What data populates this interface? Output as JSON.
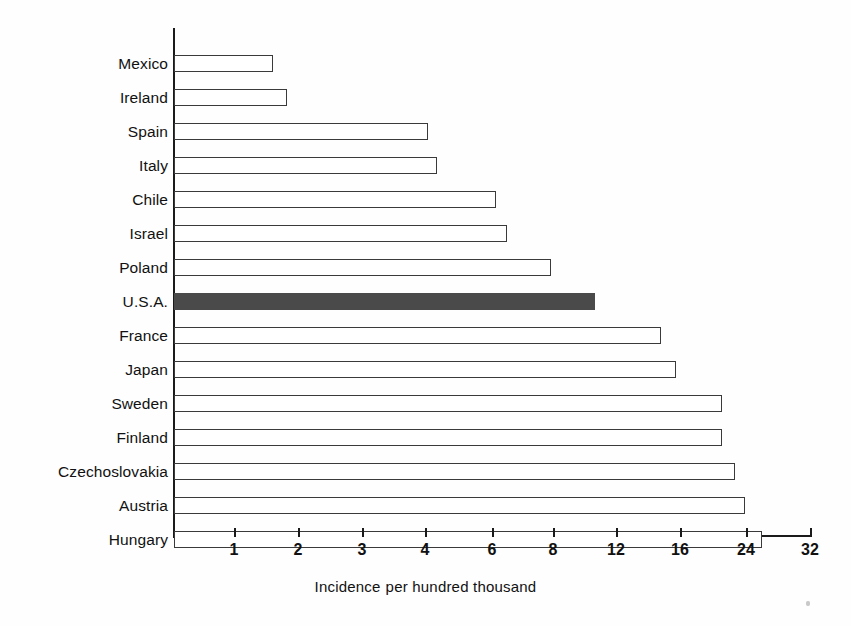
{
  "chart_data": {
    "type": "bar",
    "orientation": "horizontal",
    "title": "",
    "subtitle": "",
    "xlabel": "Incidence  per hundred thousand",
    "ylabel": "",
    "grid": false,
    "legend": null,
    "xscale": "ordinal-log-like",
    "xticks": [
      1,
      2,
      3,
      4,
      6,
      8,
      12,
      16,
      24,
      32
    ],
    "xtick_labels": [
      "1",
      "2",
      "3",
      "4",
      "6",
      "8",
      "12",
      "16",
      "24",
      "32"
    ],
    "xlim": [
      0,
      32
    ],
    "categories": [
      "Mexico",
      "Ireland",
      "Spain",
      "Italy",
      "Chile",
      "Israel",
      "Poland",
      "U.S.A.",
      "France",
      "Japan",
      "Sweden",
      "Finland",
      "Czechoslovakia",
      "Austria",
      "Hungary"
    ],
    "values": [
      1.6,
      1.8,
      4.0,
      4.2,
      6.1,
      6.4,
      7.9,
      11.0,
      14.5,
      15.7,
      20.6,
      20.6,
      22.3,
      23.8,
      25.6
    ],
    "highlighted": [
      "U.S.A."
    ],
    "bar_fill": "#ffffff",
    "bar_stroke": "#3a3a3a",
    "highlight_fill": "#4a4a4a",
    "bars": [
      {
        "label": "Mexico",
        "value": 1.6,
        "px_end": 273,
        "highlight": false
      },
      {
        "label": "Ireland",
        "value": 1.8,
        "px_end": 287,
        "highlight": false
      },
      {
        "label": "Spain",
        "value": 4.0,
        "px_end": 428,
        "highlight": false
      },
      {
        "label": "Italy",
        "value": 4.2,
        "px_end": 437,
        "highlight": false
      },
      {
        "label": "Chile",
        "value": 6.1,
        "px_end": 496,
        "highlight": false
      },
      {
        "label": "Israel",
        "value": 6.4,
        "px_end": 507,
        "highlight": false
      },
      {
        "label": "Poland",
        "value": 7.9,
        "px_end": 551,
        "highlight": false
      },
      {
        "label": "U.S.A.",
        "value": 11.0,
        "px_end": 595,
        "highlight": true
      },
      {
        "label": "France",
        "value": 14.5,
        "px_end": 661,
        "highlight": false
      },
      {
        "label": "Japan",
        "value": 15.7,
        "px_end": 676,
        "highlight": false
      },
      {
        "label": "Sweden",
        "value": 20.6,
        "px_end": 722,
        "highlight": false
      },
      {
        "label": "Finland",
        "value": 20.6,
        "px_end": 722,
        "highlight": false
      },
      {
        "label": "Czechoslovakia",
        "value": 22.3,
        "px_end": 735,
        "highlight": false
      },
      {
        "label": "Austria",
        "value": 23.8,
        "px_end": 745,
        "highlight": false
      },
      {
        "label": "Hungary",
        "value": 25.6,
        "px_end": 762,
        "highlight": false
      }
    ]
  },
  "axis": {
    "x_origin_px": 174,
    "y_top_px": 28,
    "y_bottom_px": 537,
    "x_right_px": 811,
    "tick_px": [
      234,
      298,
      362,
      425,
      492,
      553,
      616,
      680,
      746,
      810
    ],
    "first_bar_top_px": 47,
    "row_pitch_px": 34
  }
}
